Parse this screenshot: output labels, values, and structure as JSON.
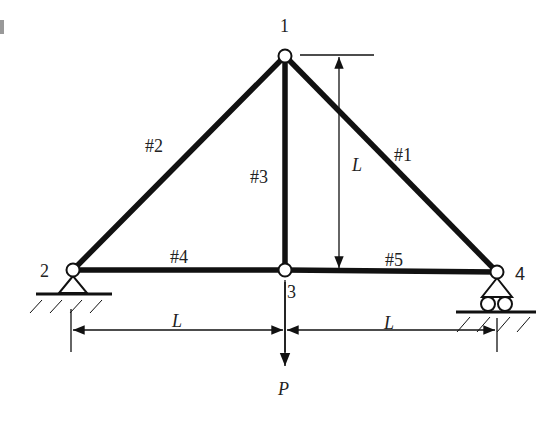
{
  "diagram": {
    "type": "plane-truss",
    "nodes": [
      {
        "id": "1",
        "label": "1",
        "x": 285,
        "y": 56
      },
      {
        "id": "2",
        "label": "2",
        "x": 73,
        "y": 270
      },
      {
        "id": "3",
        "label": "3",
        "x": 285,
        "y": 270
      },
      {
        "id": "4",
        "label": "4",
        "x": 497,
        "y": 272
      }
    ],
    "members": [
      {
        "id": "#1",
        "label": "#1",
        "from": "1",
        "to": "4"
      },
      {
        "id": "#2",
        "label": "#2",
        "from": "2",
        "to": "1"
      },
      {
        "id": "#3",
        "label": "#3",
        "from": "3",
        "to": "1"
      },
      {
        "id": "#4",
        "label": "#4",
        "from": "2",
        "to": "3"
      },
      {
        "id": "#5",
        "label": "#5",
        "from": "3",
        "to": "4"
      }
    ],
    "supports": [
      {
        "node": "2",
        "type": "pin"
      },
      {
        "node": "4",
        "type": "roller"
      }
    ],
    "load": {
      "node": "3",
      "label": "P",
      "direction": "down"
    },
    "dimensions": [
      {
        "label": "L",
        "orientation": "vertical",
        "between": [
          "1",
          "3"
        ]
      },
      {
        "label": "L",
        "orientation": "horizontal",
        "between": [
          "2",
          "3"
        ]
      },
      {
        "label": "L",
        "orientation": "horizontal",
        "between": [
          "3",
          "4"
        ]
      }
    ],
    "colors": {
      "member": "#111111",
      "node_fill": "#ffffff",
      "line": "#111111",
      "text": "#222222"
    }
  }
}
